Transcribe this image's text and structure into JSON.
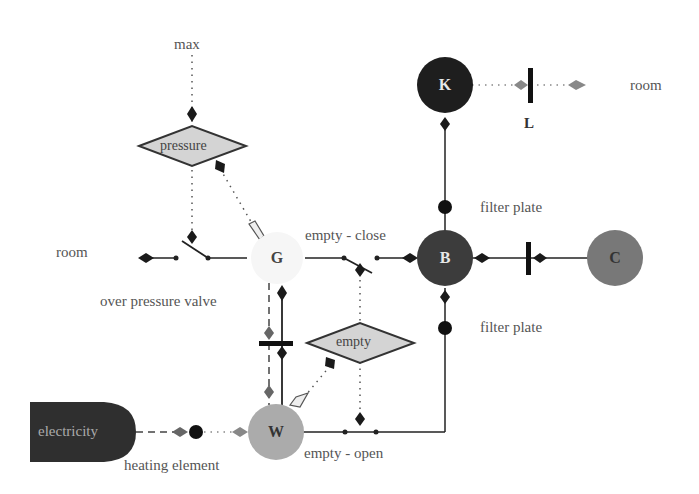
{
  "diagram": {
    "nodes": {
      "K": {
        "label": "K",
        "color": "#1e1e1e",
        "text_color": "#e8e8e8"
      },
      "B": {
        "label": "B",
        "color": "#3c3c3c",
        "text_color": "#e8e8e8"
      },
      "C": {
        "label": "C",
        "color": "#787878",
        "text_color": "#333333"
      },
      "G": {
        "label": "G",
        "color": "#f6f6f6",
        "text_color": "#444444"
      },
      "W": {
        "label": "W",
        "color": "#ababab",
        "text_color": "#333333"
      },
      "electricity": {
        "label": "electricity",
        "color": "#2f2f2f",
        "text_color": "#aaaaaa"
      }
    },
    "decisions": {
      "pressure": {
        "label": "pressure",
        "fill": "#d4d4d4"
      },
      "empty": {
        "label": "empty",
        "fill": "#d4d4d4"
      }
    },
    "labels": {
      "max": "max",
      "room_top": "room",
      "room_left": "room",
      "L": "L",
      "filter_plate_top": "filter plate",
      "filter_plate_bottom": "filter plate",
      "empty_close": "empty - close",
      "empty_open": "empty - open",
      "over_pressure_valve": "over pressure valve",
      "heating_element": "heating element"
    }
  }
}
